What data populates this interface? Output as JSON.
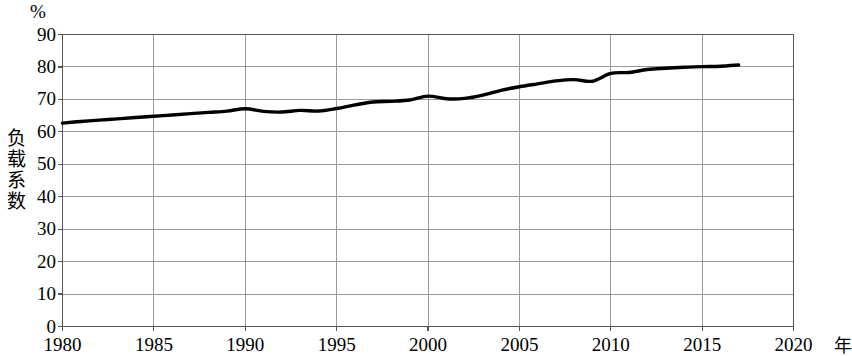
{
  "chart_data": {
    "type": "line",
    "title": "",
    "unit_label": "%",
    "ylabel": "负载系数",
    "xlabel": "年",
    "xlim": [
      1980,
      2020
    ],
    "ylim": [
      0,
      90
    ],
    "grid": true,
    "legend": false,
    "y_ticks": [
      90,
      80,
      70,
      60,
      50,
      40,
      30,
      20,
      10,
      0
    ],
    "x_ticks": [
      1980,
      1985,
      1990,
      1995,
      2000,
      2005,
      2010,
      2015,
      2020
    ],
    "line_color": "#000000",
    "grid_color": "#9a9a9a",
    "axis_color": "#555555",
    "series": [
      {
        "name": "负载系数",
        "x": [
          1980,
          1981,
          1982,
          1983,
          1984,
          1985,
          1986,
          1987,
          1988,
          1989,
          1990,
          1991,
          1992,
          1993,
          1994,
          1995,
          1996,
          1997,
          1998,
          1999,
          2000,
          2001,
          2002,
          2003,
          2004,
          2005,
          2006,
          2007,
          2008,
          2009,
          2010,
          2011,
          2012,
          2013,
          2014,
          2015,
          2016,
          2017
        ],
        "values": [
          62.7,
          63.2,
          63.6,
          64.0,
          64.4,
          64.8,
          65.2,
          65.6,
          66.0,
          66.4,
          67.1,
          66.3,
          66.1,
          66.6,
          66.4,
          67.2,
          68.3,
          69.2,
          69.4,
          69.8,
          71.0,
          70.2,
          70.3,
          71.3,
          72.8,
          73.9,
          74.8,
          75.7,
          76.1,
          75.6,
          78.0,
          78.3,
          79.2,
          79.6,
          79.9,
          80.1,
          80.2,
          80.6
        ]
      }
    ]
  },
  "axes": {
    "unit": "%",
    "y_title": "负载系数",
    "x_title": "年",
    "y_labels": [
      "90",
      "80",
      "70",
      "60",
      "50",
      "40",
      "30",
      "20",
      "10",
      "0"
    ],
    "x_labels": [
      "1980",
      "1985",
      "1990",
      "1995",
      "2000",
      "2005",
      "2010",
      "2015",
      "2020"
    ]
  }
}
